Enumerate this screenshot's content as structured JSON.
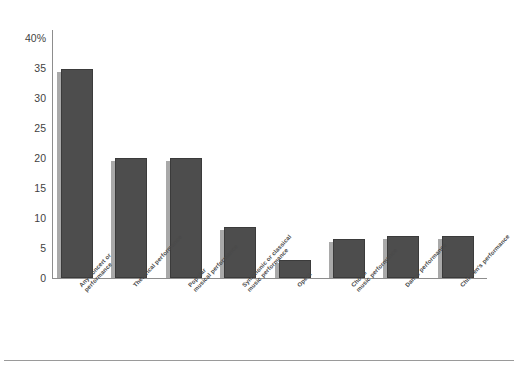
{
  "chart_data": {
    "type": "bar",
    "title": "",
    "xlabel": "",
    "ylabel": "",
    "ylim": [
      0,
      40
    ],
    "grid": false,
    "legend": null,
    "y_unit": "%",
    "y_ticks": [
      {
        "value": 40,
        "label": "40%"
      },
      {
        "value": 35,
        "label": "35"
      },
      {
        "value": 30,
        "label": "30"
      },
      {
        "value": 25,
        "label": "25"
      },
      {
        "value": 20,
        "label": "20"
      },
      {
        "value": 15,
        "label": "15"
      },
      {
        "value": 10,
        "label": "10"
      },
      {
        "value": 5,
        "label": "5"
      },
      {
        "value": 0,
        "label": "0"
      }
    ],
    "categories": [
      "Any concert or performance",
      "Theatrical performance",
      "Popular musical performance",
      "Symphonic or classical music performance",
      "Opera",
      "Choral music performance",
      "Dance performance",
      "Children's performance"
    ],
    "category_lines": [
      [
        "Any concert or",
        "performance"
      ],
      [
        "Theatrical performance"
      ],
      [
        "Popular",
        "musical performance"
      ],
      [
        "Symphonic or classical",
        "music performance"
      ],
      [
        "Opera"
      ],
      [
        "Choral",
        "music performance"
      ],
      [
        "Dance performance"
      ],
      [
        "Children's performance"
      ]
    ],
    "values": [
      34.8,
      20.0,
      20.0,
      8.5,
      3.0,
      6.5,
      7.0,
      7.0
    ],
    "colors": {
      "bar_fill": "#4d4d4d",
      "bar_edge": "#3b3b3b",
      "bar_shadow": "#a9a9a9",
      "axis": "#8d8d8d",
      "text": "#3f3f3f",
      "background": "#ffffff"
    }
  }
}
